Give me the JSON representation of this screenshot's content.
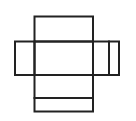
{
  "canvas": {
    "width": 136,
    "height": 121,
    "background": "#ffffff"
  },
  "diagram": {
    "type": "box-net-line-drawing",
    "stroke_color": "#222222",
    "stroke_width": 2,
    "fill": "none",
    "rects": [
      {
        "name": "top-flap",
        "x": 34.5,
        "y": 16.5,
        "w": 58.5,
        "h": 25
      },
      {
        "name": "left-flap",
        "x": 15,
        "y": 41.5,
        "w": 19.5,
        "h": 33.5
      },
      {
        "name": "center-panel",
        "x": 34.5,
        "y": 41.5,
        "w": 58.5,
        "h": 33.5
      },
      {
        "name": "right-panel",
        "x": 93,
        "y": 41.5,
        "w": 16,
        "h": 33.5
      },
      {
        "name": "right-glue-strip",
        "x": 109,
        "y": 41.5,
        "w": 10,
        "h": 33.5
      },
      {
        "name": "bottom-panel",
        "x": 34.5,
        "y": 75,
        "w": 58.5,
        "h": 23
      },
      {
        "name": "bottom-glue-strip",
        "x": 34.5,
        "y": 98,
        "w": 58.5,
        "h": 13.5
      }
    ]
  }
}
